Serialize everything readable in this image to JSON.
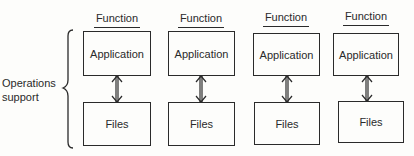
{
  "diagram": {
    "side_label": [
      "Operations",
      "support"
    ],
    "columns": [
      {
        "function_label": "Function",
        "application_label": "Application",
        "files_label": "Files"
      },
      {
        "function_label": "Function",
        "application_label": "Application",
        "files_label": "Files"
      },
      {
        "function_label": "Function",
        "application_label": "Application",
        "files_label": "Files"
      },
      {
        "function_label": "Function",
        "application_label": "Application",
        "files_label": "Files"
      }
    ],
    "connector": "bidirectional-arrow"
  }
}
